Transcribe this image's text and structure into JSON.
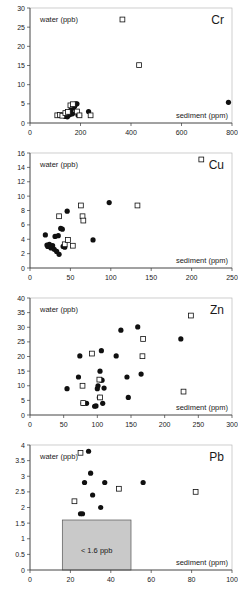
{
  "figure": {
    "panel_count": 4,
    "marker_legend": {
      "filled_circle": "filled-circle-marker",
      "open_square": "open-square-marker"
    }
  },
  "chart_data": [
    {
      "type": "scatter",
      "title": "Cr",
      "xlabel": "sediment (ppm)",
      "ylabel": "water (ppb)",
      "xlim": [
        0,
        800
      ],
      "ylim": [
        0,
        30
      ],
      "xticks": [
        0,
        200,
        400,
        600,
        800
      ],
      "yticks": [
        0,
        5,
        10,
        15,
        20,
        25,
        30
      ],
      "xticklabels": [
        "0",
        "200",
        "400",
        "600",
        "800"
      ],
      "yticklabels": [
        "0",
        "5",
        "10",
        "15",
        "20",
        "25",
        "30"
      ],
      "grid": false,
      "legend": "none",
      "series": [
        {
          "name": "filled-circle",
          "marker": "filled_circle",
          "points": [
            [
              140,
              1.7
            ],
            [
              148,
              1.6
            ],
            [
              152,
              2.0
            ],
            [
              158,
              2.2
            ],
            [
              160,
              3.2
            ],
            [
              163,
              3.5
            ],
            [
              168,
              2.4
            ],
            [
              172,
              4.0
            ],
            [
              176,
              4.3
            ],
            [
              178,
              4.6
            ],
            [
              182,
              5.0
            ],
            [
              186,
              5.0
            ],
            [
              190,
              2.1
            ],
            [
              196,
              2.0
            ],
            [
              232,
              3.0
            ],
            [
              786,
              5.4
            ]
          ]
        },
        {
          "name": "open-square",
          "marker": "open_square",
          "points": [
            [
              108,
              2.0
            ],
            [
              118,
              2.1
            ],
            [
              128,
              1.9
            ],
            [
              140,
              2.6
            ],
            [
              150,
              2.9
            ],
            [
              160,
              4.6
            ],
            [
              170,
              4.9
            ],
            [
              186,
              3.0
            ],
            [
              196,
              2.0
            ],
            [
              240,
              2.0
            ],
            [
              366,
              27.0
            ],
            [
              432,
              15.1
            ]
          ]
        }
      ]
    },
    {
      "type": "scatter",
      "title": "Cu",
      "xlabel": "sediment (ppm)",
      "ylabel": "water (ppb)",
      "xlim": [
        0,
        250
      ],
      "ylim": [
        0,
        16
      ],
      "xticks": [
        0,
        50,
        100,
        150,
        200,
        250
      ],
      "yticks": [
        0,
        2,
        4,
        6,
        8,
        10,
        12,
        14,
        16
      ],
      "xticklabels": [
        "0",
        "50",
        "100",
        "150",
        "200",
        "250"
      ],
      "yticklabels": [
        "0",
        "2",
        "4",
        "6",
        "8",
        "10",
        "12",
        "14",
        "16"
      ],
      "grid": false,
      "legend": "none",
      "series": [
        {
          "name": "filled-circle",
          "marker": "filled_circle",
          "points": [
            [
              19,
              4.6
            ],
            [
              21,
              3.2
            ],
            [
              22,
              3.0
            ],
            [
              24,
              3.3
            ],
            [
              26,
              2.8
            ],
            [
              28,
              3.1
            ],
            [
              30,
              2.6
            ],
            [
              31,
              4.4
            ],
            [
              33,
              2.3
            ],
            [
              35,
              4.5
            ],
            [
              36,
              1.9
            ],
            [
              38,
              5.5
            ],
            [
              40,
              5.4
            ],
            [
              41,
              3.0
            ],
            [
              43,
              2.9
            ],
            [
              46,
              7.9
            ],
            [
              78,
              3.9
            ],
            [
              98,
              9.1
            ]
          ]
        },
        {
          "name": "open-square",
          "marker": "open_square",
          "points": [
            [
              36,
              7.2
            ],
            [
              43,
              3.3
            ],
            [
              47,
              3.9
            ],
            [
              53,
              3.1
            ],
            [
              63,
              8.7
            ],
            [
              65,
              7.2
            ],
            [
              66,
              6.6
            ],
            [
              133,
              8.7
            ],
            [
              212,
              15.1
            ]
          ]
        }
      ]
    },
    {
      "type": "scatter",
      "title": "Zn",
      "xlabel": "sediment (ppm)",
      "ylabel": "water (ppb)",
      "xlim": [
        0,
        300
      ],
      "ylim": [
        0,
        40
      ],
      "xticks": [
        0,
        50,
        100,
        150,
        200,
        250,
        300
      ],
      "yticks": [
        0,
        5,
        10,
        15,
        20,
        25,
        30,
        35,
        40
      ],
      "xticklabels": [
        "0",
        "50",
        "100",
        "150",
        "200",
        "250",
        "300"
      ],
      "yticklabels": [
        "0",
        "5",
        "10",
        "15",
        "20",
        "25",
        "30",
        "35",
        "40"
      ],
      "grid": false,
      "legend": "none",
      "series": [
        {
          "name": "filled-circle",
          "marker": "filled_circle",
          "points": [
            [
              55,
              9.0
            ],
            [
              72,
              13.0
            ],
            [
              74,
              20.2
            ],
            [
              79,
              4.0
            ],
            [
              84,
              4.0
            ],
            [
              96,
              3.0
            ],
            [
              98,
              3.1
            ],
            [
              100,
              9.0
            ],
            [
              101,
              10.0
            ],
            [
              103,
              6.0
            ],
            [
              104,
              15.0
            ],
            [
              105,
              12.0
            ],
            [
              106,
              22.0
            ],
            [
              107,
              11.9
            ],
            [
              108,
              4.0
            ],
            [
              110,
              9.2
            ],
            [
              128,
              20.2
            ],
            [
              135,
              29.0
            ],
            [
              144,
              13.0
            ],
            [
              146,
              6.0
            ],
            [
              160,
              30.1
            ],
            [
              165,
              14.0
            ],
            [
              224,
              26.0
            ]
          ]
        },
        {
          "name": "open-square",
          "marker": "open_square",
          "points": [
            [
              78,
              10.0
            ],
            [
              79,
              4.1
            ],
            [
              92,
              21.0
            ],
            [
              103,
              12.1
            ],
            [
              104,
              6.0
            ],
            [
              167,
              20.1
            ],
            [
              168,
              26.0
            ],
            [
              228,
              8.0
            ],
            [
              239,
              34.0
            ]
          ]
        }
      ]
    },
    {
      "type": "scatter",
      "title": "Pb",
      "xlabel": "sediment (ppm)",
      "ylabel": "water (ppb)",
      "xlim": [
        0,
        100
      ],
      "ylim": [
        0,
        4
      ],
      "xticks": [
        0,
        20,
        40,
        60,
        80,
        100
      ],
      "yticks": [
        0,
        0.5,
        1,
        1.5,
        2,
        2.5,
        3,
        3.5,
        4
      ],
      "xticklabels": [
        "0",
        "20",
        "40",
        "60",
        "80",
        "100"
      ],
      "yticklabels": [
        "0",
        "0.5",
        "1",
        "1.5",
        "2",
        "2.5",
        "3",
        "3.5",
        "4"
      ],
      "grid": false,
      "legend": "none",
      "annotation": {
        "text": "< 1.6 ppb",
        "region_x": [
          16,
          50
        ],
        "region_y": [
          0,
          1.6
        ]
      },
      "series": [
        {
          "name": "filled-circle",
          "marker": "filled_circle",
          "points": [
            [
              25,
              1.8
            ],
            [
              26,
              1.8
            ],
            [
              27,
              2.8
            ],
            [
              29,
              3.8
            ],
            [
              30,
              3.1
            ],
            [
              31,
              2.4
            ],
            [
              35,
              2.0
            ],
            [
              37,
              2.8
            ],
            [
              56,
              2.8
            ]
          ]
        },
        {
          "name": "open-square",
          "marker": "open_square",
          "points": [
            [
              22,
              2.2
            ],
            [
              25,
              3.75
            ],
            [
              44,
              2.6
            ],
            [
              82,
              2.5
            ]
          ]
        }
      ]
    }
  ]
}
